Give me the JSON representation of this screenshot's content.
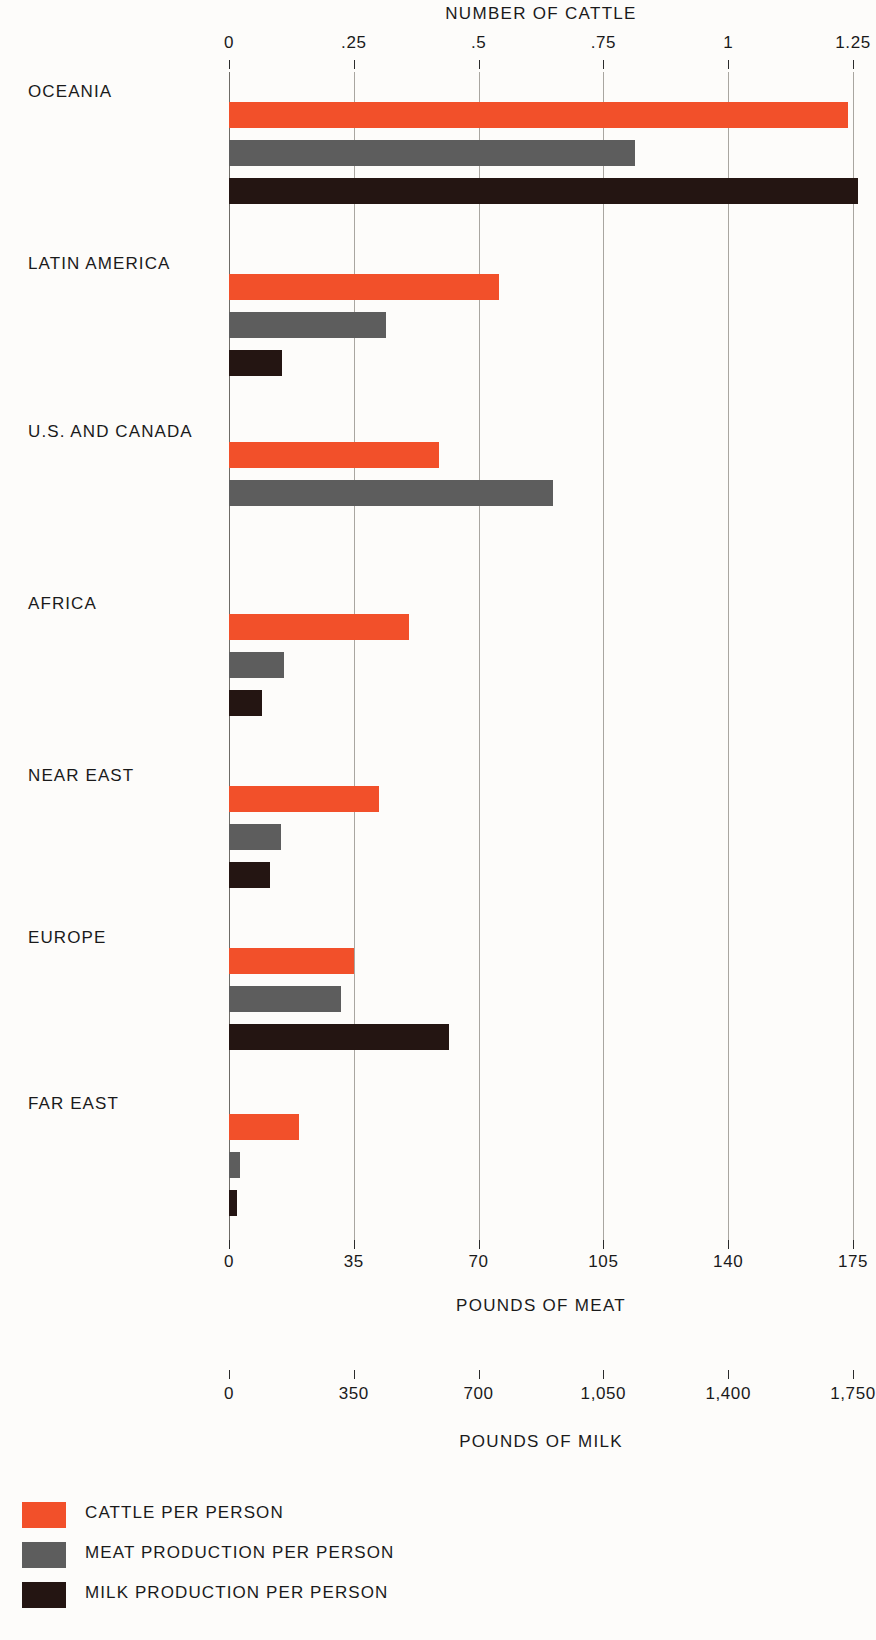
{
  "chart_data": {
    "type": "bar",
    "orientation": "horizontal",
    "title": "NUMBER OF CATTLE",
    "grid": true,
    "legend_position": "bottom-left",
    "categories": [
      "OCEANIA",
      "LATIN AMERICA",
      "U.S. AND CANADA",
      "AFRICA",
      "NEAR EAST",
      "EUROPE",
      "FAR EAST"
    ],
    "series": [
      {
        "name": "CATTLE PER PERSON",
        "color": "#f2502a",
        "axis": "NUMBER OF CATTLE",
        "values": [
          1.24,
          0.54,
          0.42,
          0.36,
          0.3,
          0.25,
          0.14
        ]
      },
      {
        "name": "MEAT PRODUCTION PER PERSON",
        "color": "#5d5d5d",
        "axis": "POUNDS OF MEAT",
        "values": [
          114,
          44,
          91,
          15.5,
          14.5,
          31.5,
          3
        ]
      },
      {
        "name": "MILK PRODUCTION PER PERSON",
        "color": "#241512",
        "axis": "POUNDS OF MILK",
        "values": [
          1765,
          150,
          null,
          92,
          115,
          617,
          22
        ]
      }
    ],
    "axes": [
      {
        "id": "cattle",
        "label": "NUMBER OF CATTLE",
        "position": "top",
        "range": [
          0,
          1.25
        ],
        "ticks": [
          0,
          0.25,
          0.5,
          0.75,
          1,
          1.25
        ],
        "tick_labels": [
          "0",
          ".25",
          ".5",
          ".75",
          "1",
          "1.25"
        ]
      },
      {
        "id": "meat",
        "label": "POUNDS OF MEAT",
        "position": "bottom",
        "range": [
          0,
          175
        ],
        "ticks": [
          0,
          35,
          70,
          105,
          140,
          175
        ],
        "tick_labels": [
          "0",
          "35",
          "70",
          "105",
          "140",
          "175"
        ]
      },
      {
        "id": "milk",
        "label": "POUNDS OF MILK",
        "position": "bottom",
        "range": [
          0,
          1750
        ],
        "ticks": [
          0,
          350,
          700,
          1050,
          1400,
          1750
        ],
        "tick_labels": [
          "0",
          "350",
          "700",
          "1,050",
          "1,400",
          "1,750"
        ]
      }
    ],
    "legend": [
      {
        "label": "CATTLE PER PERSON",
        "color": "#f2502a",
        "swatch": "cattle"
      },
      {
        "label": "MEAT PRODUCTION PER PERSON",
        "color": "#5d5d5d",
        "swatch": "meat"
      },
      {
        "label": "MILK PRODUCTION PER PERSON",
        "color": "#241512",
        "swatch": "milk"
      }
    ]
  },
  "layout": {
    "plot_left_px": 229,
    "plot_right_px": 853,
    "bar_height_px": 26,
    "group_tops_px": [
      16,
      188,
      356,
      528,
      700,
      862,
      1028
    ],
    "label_tops_px": [
      10,
      182,
      350,
      522,
      694,
      856,
      1022
    ],
    "bar_offsets_px": [
      14,
      52,
      90
    ]
  }
}
